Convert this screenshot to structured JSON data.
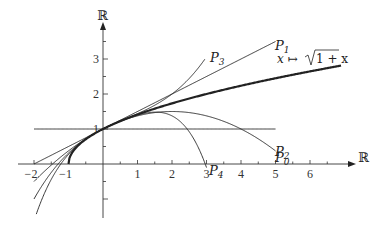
{
  "diagram": {
    "axes": {
      "x_label": "ℝ",
      "y_label": "ℝ",
      "x_ticks": [
        -2,
        -1,
        1,
        2,
        3,
        4,
        5,
        6
      ],
      "x_tick_labels": [
        "−2",
        "−1",
        "1",
        "2",
        "3",
        "4",
        "5",
        "6"
      ],
      "y_ticks": [
        1,
        2,
        3
      ],
      "y_tick_labels": [
        "1",
        "2",
        "3"
      ],
      "xlim": [
        -2,
        6.9
      ],
      "ylim": [
        -1.4,
        3.9
      ]
    },
    "curves": [
      {
        "id": "sqrt",
        "label": "x ↦ √(1+x)",
        "formula": "sqrt(1+x)",
        "domain": [
          -1,
          6.9
        ],
        "stroke_width": 2.2
      },
      {
        "id": "P0",
        "label": "P0",
        "formula": "1",
        "domain": [
          -2,
          5
        ],
        "stroke_width": 0.9
      },
      {
        "id": "P1",
        "label": "P1",
        "formula": "1 + x/2",
        "domain": [
          -2,
          5
        ],
        "stroke_width": 0.9
      },
      {
        "id": "P2",
        "label": "P2",
        "formula": "1 + x/2 - x^2/8",
        "domain": [
          -2,
          5
        ],
        "stroke_width": 0.9
      },
      {
        "id": "P3",
        "label": "P3",
        "formula": "1 + x/2 - x^2/8 + x^3/16",
        "domain": [
          -2,
          2.95
        ],
        "stroke_width": 0.9
      },
      {
        "id": "P4",
        "label": "P4",
        "formula": "1 + x/2 - x^2/8 + x^3/16 - 5x^4/128",
        "domain": [
          -2,
          3
        ],
        "stroke_width": 0.9
      }
    ],
    "labels": {
      "P0": "P",
      "P0_sub": "0",
      "P1": "P",
      "P1_sub": "1",
      "P2": "P",
      "P2_sub": "2",
      "P3": "P",
      "P3_sub": "3",
      "P4": "P",
      "P4_sub": "4",
      "func_pre": "x ↦ ",
      "func_radicand": "1 + x"
    },
    "colors": {
      "stroke": "#222222",
      "background": "#ffffff"
    }
  }
}
